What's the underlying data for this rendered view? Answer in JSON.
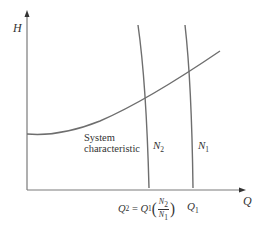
{
  "diagram": {
    "type": "pump-system-characteristic",
    "axes": {
      "y_label": "H",
      "x_label": "Q"
    },
    "curves": {
      "system": {
        "label_line1": "System",
        "label_line2": "characteristic"
      },
      "pump_n1": {
        "label": "N",
        "subscript": "1"
      },
      "pump_n2": {
        "label": "N",
        "subscript": "2"
      }
    },
    "x_ticks": {
      "q2": {
        "lhs": "Q",
        "lhs_sub": "2",
        "equals": " = ",
        "rhs": "Q",
        "rhs_sub": "1",
        "frac_num": "N",
        "frac_num_sub": "2",
        "frac_den": "N",
        "frac_den_sub": "1"
      },
      "q1": {
        "label": "Q",
        "subscript": "1"
      }
    },
    "colors": {
      "line": "#6e6e6e",
      "axis": "#7a7a7a",
      "text": "#333333",
      "background": "#ffffff"
    }
  }
}
